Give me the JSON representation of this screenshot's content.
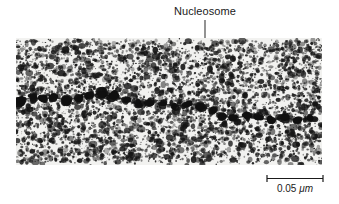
{
  "figure": {
    "type": "electron-micrograph",
    "background_color": "#ffffff",
    "width": 339,
    "height": 204
  },
  "annotation": {
    "label": "Nucleosome",
    "leader_line_color": "#333333",
    "bracket_color": "#1a1a1a"
  },
  "scale": {
    "value": "0.05",
    "unit": "μm",
    "full_text": "0.05 μm",
    "bar_length_px": 58,
    "tick_color": "#1a1a1a"
  },
  "micrograph": {
    "description": "beads-on-a-string chromatin fiber",
    "plate_tone": "#f2f2f0",
    "grain_color": "#151515",
    "bead_color": "#101010",
    "left": 16,
    "top": 38,
    "width": 306,
    "height": 127
  },
  "chart_data": {
    "type": "scatter",
    "xlabel": "",
    "ylabel": "",
    "beads": [
      {
        "x": 4,
        "y": 62,
        "r": 6.0
      },
      {
        "x": 17,
        "y": 60,
        "r": 5.2
      },
      {
        "x": 28,
        "y": 61,
        "r": 4.4
      },
      {
        "x": 38,
        "y": 59,
        "r": 4.0
      },
      {
        "x": 49,
        "y": 62,
        "r": 5.4
      },
      {
        "x": 62,
        "y": 60,
        "r": 4.6
      },
      {
        "x": 73,
        "y": 58,
        "r": 4.2
      },
      {
        "x": 84,
        "y": 56,
        "r": 5.6
      },
      {
        "x": 97,
        "y": 58,
        "r": 4.8
      },
      {
        "x": 110,
        "y": 62,
        "r": 4.4
      },
      {
        "x": 122,
        "y": 66,
        "r": 4.0
      },
      {
        "x": 134,
        "y": 64,
        "r": 4.6
      },
      {
        "x": 147,
        "y": 66,
        "r": 4.2
      },
      {
        "x": 159,
        "y": 68,
        "r": 3.8
      },
      {
        "x": 172,
        "y": 66,
        "r": 4.4
      },
      {
        "x": 184,
        "y": 68,
        "r": 5.2
      },
      {
        "x": 196,
        "y": 72,
        "r": 4.0
      },
      {
        "x": 205,
        "y": 78,
        "r": 4.6
      },
      {
        "x": 218,
        "y": 80,
        "r": 4.2
      },
      {
        "x": 231,
        "y": 78,
        "r": 3.8
      },
      {
        "x": 243,
        "y": 80,
        "r": 4.4
      },
      {
        "x": 255,
        "y": 82,
        "r": 4.0
      },
      {
        "x": 268,
        "y": 80,
        "r": 4.6
      },
      {
        "x": 281,
        "y": 82,
        "r": 4.2
      },
      {
        "x": 294,
        "y": 80,
        "r": 3.6
      }
    ],
    "marked_bead_index": 16,
    "bracket": {
      "x1": 180,
      "x2": 198,
      "y": 62
    }
  }
}
